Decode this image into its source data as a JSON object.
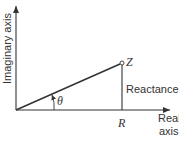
{
  "diagram": {
    "type": "impedance-phasor",
    "axes": {
      "vertical_label": "Imaginary axis",
      "horizontal_label_line1": "Real",
      "horizontal_label_line2": "axis"
    },
    "points": {
      "impedance_label": "Z",
      "resistance_label": "R"
    },
    "segments": {
      "reactance_label_text": "Reactance ",
      "reactance_symbol": "S"
    },
    "angle": {
      "label": "θ"
    },
    "colors": {
      "stroke": "#333333",
      "background": "#ffffff"
    }
  }
}
